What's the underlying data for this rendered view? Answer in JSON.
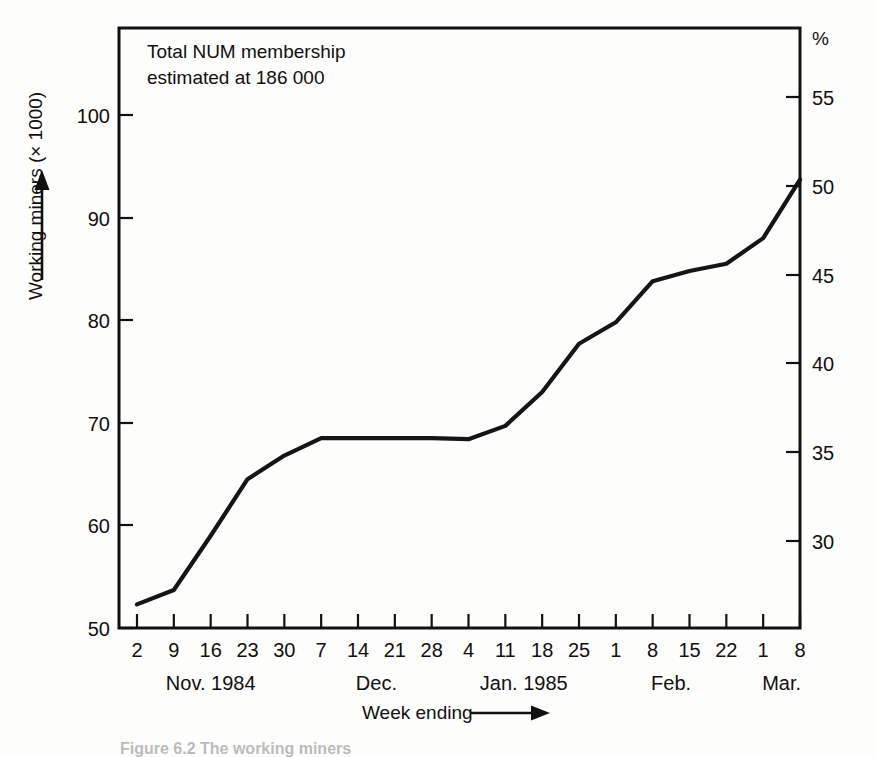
{
  "figure": {
    "caption": "Figure 6.2 The working miners",
    "annotation_line1": "Total NUM membership",
    "annotation_line2": "estimated at 186 000",
    "ink_color": "#151515",
    "background_color": "#fdfdfb"
  },
  "axes": {
    "y_left_title": "Working miners (× 1000)",
    "y_right_unit": "%",
    "x_title": "Week ending",
    "x_title_arrow": "arrow-right",
    "y_left_arrow": "arrow-up"
  },
  "chart_data": {
    "type": "line",
    "title": "",
    "xlabel": "Week ending",
    "ylabel": "Working miners (× 1000)",
    "y2label": "%",
    "ylim": [
      50,
      100
    ],
    "yticks": [
      50,
      60,
      70,
      80,
      90,
      100
    ],
    "y2lim": [
      27.0,
      56.5
    ],
    "y2ticks": [
      30,
      35,
      40,
      45,
      50,
      55
    ],
    "grid": false,
    "legend": null,
    "annotations": [
      "Total NUM membership",
      "estimated at 186 000"
    ],
    "categories": [
      "2",
      "9",
      "16",
      "23",
      "30",
      "7",
      "14",
      "21",
      "28",
      "4",
      "11",
      "18",
      "25",
      "1",
      "8",
      "15",
      "22",
      "1",
      "8"
    ],
    "month_groups": [
      {
        "label": "Nov. 1984",
        "start_index": 0,
        "end_index": 4
      },
      {
        "label": "Dec.",
        "start_index": 5,
        "end_index": 8
      },
      {
        "label": "Jan. 1985",
        "start_index": 9,
        "end_index": 12
      },
      {
        "label": "Feb.",
        "start_index": 13,
        "end_index": 16
      },
      {
        "label": "Mar.",
        "start_index": 17,
        "end_index": 18
      }
    ],
    "series": [
      {
        "name": "Working miners",
        "values": [
          52.3,
          53.7,
          59.0,
          64.5,
          66.8,
          68.5,
          68.5,
          68.5,
          68.5,
          68.4,
          69.7,
          73.0,
          77.7,
          79.8,
          83.8,
          84.8,
          85.5,
          88.0,
          93.7
        ],
        "percent_values": [
          28.1,
          28.9,
          31.7,
          34.7,
          35.9,
          36.8,
          36.8,
          36.8,
          36.8,
          36.8,
          37.5,
          39.2,
          41.8,
          42.9,
          45.1,
          45.6,
          46.0,
          47.3,
          50.4
        ]
      }
    ]
  }
}
